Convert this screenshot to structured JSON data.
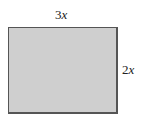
{
  "figure": {
    "shape": "rectangle",
    "fill_color": "#cfcfcf",
    "border_color": "#555555",
    "labels": {
      "width_coef": "3",
      "width_var": "x",
      "height_coef": "2",
      "height_var": "x"
    }
  }
}
